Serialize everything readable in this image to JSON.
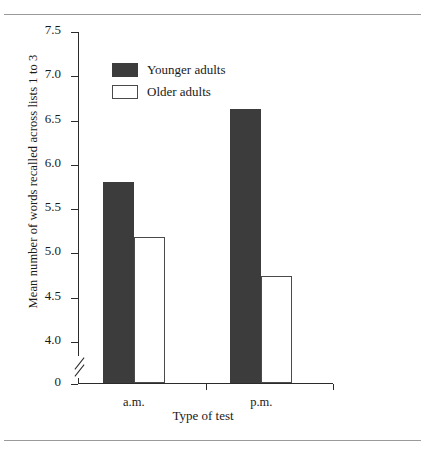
{
  "figure": {
    "background": "#ffffff",
    "rule_color": "#9a9a9a"
  },
  "chart_data": {
    "type": "bar",
    "title": "",
    "xlabel": "Type of test",
    "ylabel": "Mean number of words recalled across lists 1 to 3",
    "categories": [
      "a.m.",
      "p.m."
    ],
    "series": [
      {
        "name": "Younger adults",
        "color": "#3c3c3c",
        "values": [
          5.8,
          6.62
        ]
      },
      {
        "name": "Older adults",
        "color": "#ffffff",
        "values": [
          5.17,
          4.73
        ]
      }
    ],
    "ylim": [
      4.0,
      7.5
    ],
    "axis_break": true,
    "axis_break_between": [
      0,
      4.0
    ],
    "yticks": [
      "7.5",
      "7.0",
      "6.5",
      "6.0",
      "5.5",
      "5.0",
      "4.5",
      "4.0",
      "0"
    ],
    "ytick_values": [
      7.5,
      7.0,
      6.5,
      6.0,
      5.5,
      5.0,
      4.5,
      4.0,
      0
    ],
    "grid": false,
    "legend_position": "upper-left-inside"
  },
  "legend": {
    "entries": [
      {
        "label": "Younger adults",
        "swatch": "filled-dark"
      },
      {
        "label": "Older adults",
        "swatch": "open-white"
      }
    ]
  },
  "axes": {
    "y_tick_labels": [
      "7.5",
      "7.0",
      "6.5",
      "6.0",
      "5.5",
      "5.0",
      "4.5",
      "4.0",
      "0"
    ],
    "x_tick_labels": [
      "a.m.",
      "p.m."
    ],
    "y_axis_title": "Mean number of words recalled across lists 1 to 3",
    "x_axis_title": "Type of test"
  }
}
